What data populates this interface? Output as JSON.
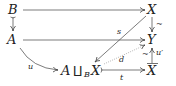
{
  "diagram": {
    "type": "commutative-diagram",
    "nodes": {
      "B": "B",
      "A": "A",
      "X": "X",
      "Y": "Y",
      "Xbar": "X",
      "pushout_A": "A",
      "pushout_coprod": "⨿",
      "pushout_sub": "B",
      "pushout_X": "X"
    },
    "labels": {
      "s": "s",
      "d": "d",
      "t": "t",
      "u": "u",
      "uprime": "u′",
      "tilde_XY": "~",
      "tilde_XbarY": "~"
    },
    "edges": [
      {
        "from": "B",
        "to": "X",
        "style": "solid"
      },
      {
        "from": "B",
        "to": "A",
        "style": "cofibration"
      },
      {
        "from": "A",
        "to": "Y",
        "style": "solid"
      },
      {
        "from": "X",
        "to": "Y",
        "label": "~",
        "style": "solid"
      },
      {
        "from": "Xbar",
        "to": "Y",
        "label": "u′",
        "extra": "~",
        "style": "solid"
      },
      {
        "from": "X",
        "to": "A⨿_B X",
        "label": "s",
        "style": "solid"
      },
      {
        "from": "A⨿_B X",
        "to": "Y",
        "label": "d",
        "style": "dotted"
      },
      {
        "from": "A⨿_B X",
        "to": "Xbar",
        "label": "t",
        "style": "cofibration"
      },
      {
        "from": "A",
        "to": "A⨿_B X",
        "label": "u",
        "style": "curved"
      }
    ],
    "line_color": "#444444"
  }
}
